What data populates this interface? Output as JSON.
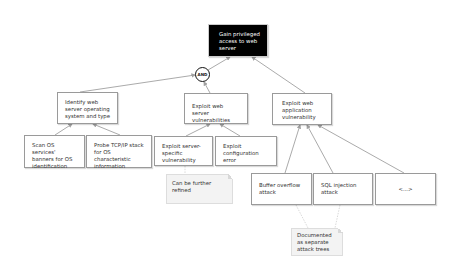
{
  "diagram": {
    "type": "attack-tree",
    "root": {
      "label": "Gain privileged access to web server"
    },
    "gate": {
      "label": "AND"
    },
    "level1": [
      {
        "id": "identify",
        "label": "Identify web server operating system and type"
      },
      {
        "id": "exploit_server",
        "label": "Exploit web server vulnerabilities"
      },
      {
        "id": "exploit_app",
        "label": "Exploit web application vulnerability"
      }
    ],
    "level2": [
      {
        "id": "scan",
        "parent": "identify",
        "label": "Scan OS services' banners for OS identification"
      },
      {
        "id": "probe",
        "parent": "identify",
        "label": "Probe TCP/IP stack for OS characteristic information"
      },
      {
        "id": "server_specific",
        "parent": "exploit_server",
        "label": "Exploit server-specific vulnerability"
      },
      {
        "id": "config_error",
        "parent": "exploit_server",
        "label": "Exploit configuration error"
      },
      {
        "id": "buffer_overflow",
        "parent": "exploit_app",
        "label": "Buffer overflow attack"
      },
      {
        "id": "sql_injection",
        "parent": "exploit_app",
        "label": "SQL injection attack"
      },
      {
        "id": "more",
        "parent": "exploit_app",
        "label": "<...>"
      }
    ],
    "notes": [
      {
        "id": "refine_note",
        "attached_to": [
          "server_specific"
        ],
        "label": "Can be further refined"
      },
      {
        "id": "separate_note",
        "attached_to": [
          "buffer_overflow",
          "sql_injection"
        ],
        "label": "Documented as separate attack trees"
      }
    ],
    "colors": {
      "root_fill": "#000000",
      "root_text": "#ffffff",
      "node_border": "#9a9a9a",
      "edge": "#a0a0a0",
      "note_fill": "#f3f3f3"
    }
  }
}
